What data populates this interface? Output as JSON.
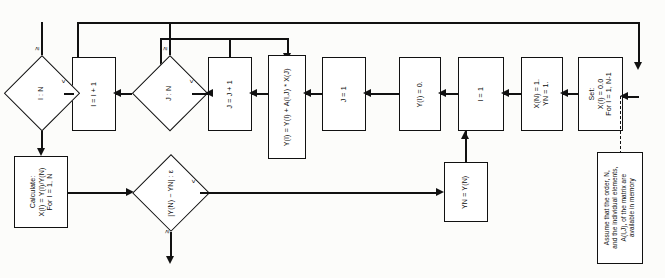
{
  "diagram": {
    "orientation": "text-rotated-90-ccw",
    "accent_color": "#111111",
    "background_color": "#fcfcfa"
  },
  "nodes": {
    "start_set": {
      "kind": "process",
      "text": "Set:\nX(I) = 0.0\nFor I = 1, N-1"
    },
    "set_xn_yn": {
      "kind": "process",
      "text": "X(N) = 1.\nYN = 1."
    },
    "i_init": {
      "kind": "process",
      "text": "I = 1"
    },
    "y_zero": {
      "kind": "process",
      "text": "Y(I) = 0."
    },
    "j_init": {
      "kind": "process",
      "text": "J = 1"
    },
    "accumulate": {
      "kind": "process",
      "text": "Y(I) = Y(I) + A(I,J) * X(J)"
    },
    "j_incr": {
      "kind": "process",
      "text": "J = J + 1"
    },
    "j_test": {
      "kind": "decision",
      "text": "J : N"
    },
    "i_incr": {
      "kind": "process",
      "text": "I = I + 1"
    },
    "i_test": {
      "kind": "decision",
      "text": "I : N"
    },
    "calculate": {
      "kind": "process",
      "text": "Calculate:\nX(I) = Y(I)/Y(N)\nFor I = 1, N"
    },
    "converge_test": {
      "kind": "decision",
      "text": "|Y(N) − YN| : ε"
    },
    "yn_update": {
      "kind": "process",
      "text": "YN = Y(N)"
    },
    "note": {
      "kind": "annotation",
      "text": "Assume that the order, N,\nand the individual elements,\nA(I,J), of the matrix are\navailable in memory"
    }
  },
  "branch_labels": {
    "j_test_ge": "≥",
    "j_test_lt": "<",
    "i_test_ge": "≥",
    "i_test_lt": "<",
    "converge_lt": "<",
    "converge_ge": "≥"
  }
}
